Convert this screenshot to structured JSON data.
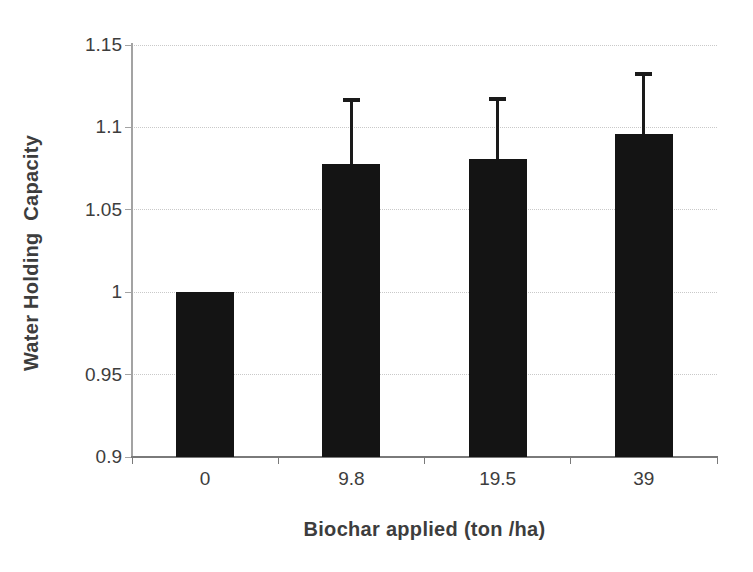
{
  "chart_data": {
    "type": "bar",
    "title": "",
    "xlabel": "Biochar applied (ton /ha)",
    "ylabel": "Water Holding  Capacity",
    "categories": [
      "0",
      "9.8",
      "19.5",
      "39"
    ],
    "values": [
      1.0,
      1.078,
      1.081,
      1.096
    ],
    "errors_upper": [
      0,
      0.039,
      0.037,
      0.037
    ],
    "error_bar_tops": [
      null,
      1.117,
      1.118,
      1.133
    ],
    "ylim": [
      0.9,
      1.15
    ],
    "ytick_step": 0.05,
    "ytick_labels": [
      "0.9",
      "0.95",
      "1",
      "1.05",
      "1.1",
      "1.15"
    ],
    "grid": "horizontal-dotted",
    "legend": "none",
    "colors": {
      "bar": "#141414",
      "error_bar": "#1a1a1a",
      "gridline": "#c9c9c9",
      "y_axis_line": "#a3a3a3",
      "x_axis_line": "#7a7a7a",
      "text": "#3d3d3d",
      "background": "#ffffff"
    }
  }
}
